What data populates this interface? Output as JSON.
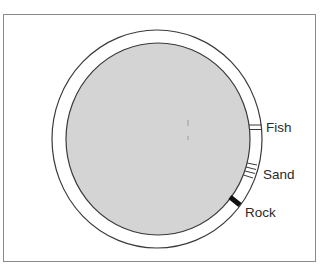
{
  "diagram": {
    "type": "cross-section",
    "colors": {
      "frame": "#8a8a8a",
      "outer_ring_fill": "#ffffff",
      "outline": "#3a3a3a",
      "core_fill": "#d4d4d4",
      "rock_band": "#111111",
      "label_text": "#2a2a2a"
    },
    "labels": {
      "fish": "Fish",
      "sand": "Sand",
      "rock": "Rock"
    }
  }
}
